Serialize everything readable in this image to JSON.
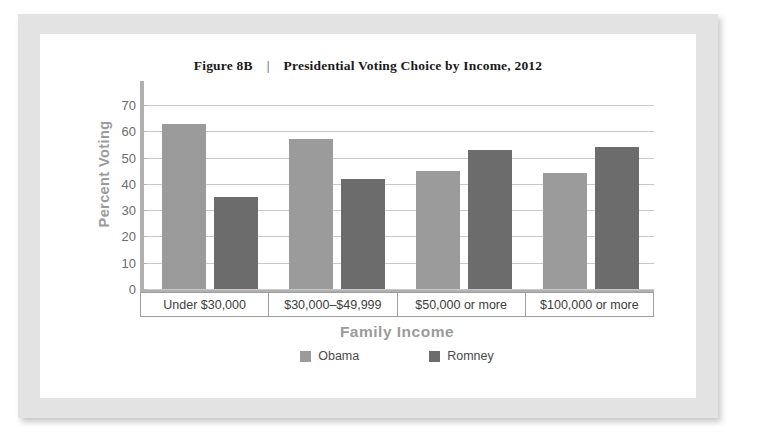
{
  "figure": {
    "number": "Figure 8B",
    "separator": "|",
    "title": "Presidential Voting Choice by Income, 2012"
  },
  "colors": {
    "obama": "#9b9b9b",
    "romney": "#6c6c6c",
    "frame": "#e3e3e3",
    "gridline": "#c9c9c9",
    "axis": "#b0b0b0",
    "axis_title": "#9b9b9b"
  },
  "chart_data": {
    "type": "bar",
    "title": "Presidential Voting Choice by Income, 2012",
    "xlabel": "Family Income",
    "ylabel": "Percent Voting",
    "ylim": [
      0,
      75
    ],
    "yticks": [
      0,
      10,
      20,
      30,
      40,
      50,
      60,
      70
    ],
    "grid": true,
    "legend_position": "bottom",
    "categories": [
      "Under $30,000",
      "$30,000–$49,999",
      "$50,000 or more",
      "$100,000 or more"
    ],
    "series": [
      {
        "name": "Obama",
        "values": [
          63,
          57,
          45,
          44
        ]
      },
      {
        "name": "Romney",
        "values": [
          35,
          42,
          53,
          54
        ]
      }
    ]
  }
}
